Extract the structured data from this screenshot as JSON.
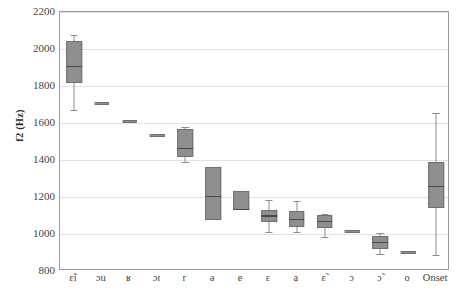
{
  "chart_data": {
    "type": "box",
    "title": "",
    "xlabel": "",
    "ylabel": "f2 (Hz)",
    "ylim": [
      800,
      2200
    ],
    "ytick_step": 200,
    "yticks": [
      800,
      1000,
      1200,
      1400,
      1600,
      1800,
      2000,
      2200
    ],
    "grid": true,
    "legend": "none",
    "categories": [
      "ɛ̃i",
      "ɔu",
      "ʁ",
      "ɔɪ",
      "r",
      "ə",
      "e",
      "ɛ",
      "a",
      "ɛ̃",
      "ɔ",
      "ɔ̃",
      "o",
      "Onset"
    ],
    "boxes": [
      {
        "category": "ɛ̃i",
        "whisker_low": 1670,
        "q1": 1815,
        "median": 1905,
        "q3": 2045,
        "whisker_high": 2075,
        "flat": false
      },
      {
        "category": "ɔu",
        "whisker_low": 1705,
        "q1": 1702,
        "median": 1705,
        "q3": 1710,
        "whisker_high": 1710,
        "flat": true
      },
      {
        "category": "ʁ",
        "whisker_low": 1608,
        "q1": 1606,
        "median": 1608,
        "q3": 1610,
        "whisker_high": 1610,
        "flat": true
      },
      {
        "category": "ɔɪ",
        "whisker_low": 1535,
        "q1": 1533,
        "median": 1535,
        "q3": 1537,
        "whisker_high": 1537,
        "flat": true
      },
      {
        "category": "r",
        "whisker_low": 1390,
        "q1": 1415,
        "median": 1462,
        "q3": 1565,
        "whisker_high": 1578,
        "flat": false
      },
      {
        "category": "ə",
        "whisker_low": 1075,
        "q1": 1075,
        "median": 1202,
        "q3": 1362,
        "whisker_high": 1362,
        "flat": false
      },
      {
        "category": "e",
        "whisker_low": 1130,
        "q1": 1130,
        "median": 1134,
        "q3": 1232,
        "whisker_high": 1232,
        "flat": false
      },
      {
        "category": "ɛ",
        "whisker_low": 1013,
        "q1": 1063,
        "median": 1098,
        "q3": 1130,
        "whisker_high": 1185,
        "flat": false
      },
      {
        "category": "a",
        "whisker_low": 1013,
        "q1": 1040,
        "median": 1080,
        "q3": 1122,
        "whisker_high": 1178,
        "flat": false
      },
      {
        "category": "ɛ̃",
        "whisker_low": 985,
        "q1": 1030,
        "median": 1068,
        "q3": 1105,
        "whisker_high": 1110,
        "flat": false
      },
      {
        "category": "ɔ",
        "whisker_low": 1013,
        "q1": 1012,
        "median": 1015,
        "q3": 1018,
        "whisker_high": 1018,
        "flat": true
      },
      {
        "category": "ɔ̃",
        "whisker_low": 890,
        "q1": 920,
        "median": 955,
        "q3": 990,
        "whisker_high": 1005,
        "flat": false
      },
      {
        "category": "o",
        "whisker_low": 902,
        "q1": 900,
        "median": 902,
        "q3": 905,
        "whisker_high": 905,
        "flat": true
      },
      {
        "category": "Onset",
        "whisker_low": 885,
        "q1": 1140,
        "median": 1258,
        "q3": 1390,
        "whisker_high": 1655,
        "flat": false
      }
    ]
  },
  "axis": {
    "y_label_text": "f2 (Hz)",
    "y_tick_labels": [
      "2200",
      "2000",
      "1800",
      "1600",
      "1400",
      "1200",
      "1000",
      "800"
    ]
  },
  "colors": {
    "box_fill": "#8f8f8f",
    "box_stroke": "#6f6f6f",
    "median": "#4a4a4a",
    "whisker": "#8c8c8c",
    "gridline": "#e2e2e2",
    "axis": "#9a9a9a",
    "text": "#3f3f3f",
    "background": "#ffffff"
  }
}
